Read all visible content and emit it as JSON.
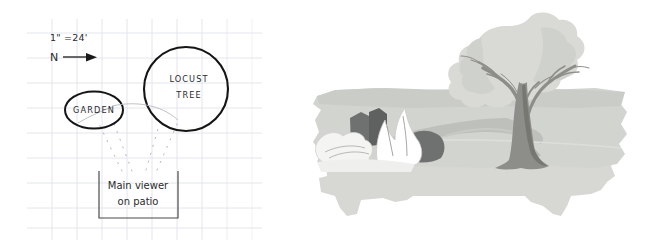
{
  "figure": {
    "type": "landscape-design-illustration",
    "panels": [
      "site-plan-sketch",
      "perspective-view-sketch"
    ]
  },
  "plan": {
    "scale_note": "1\" =24'",
    "north_label": "N",
    "north_arrow_glyph": "arrow-right",
    "elements": [
      {
        "name": "garden",
        "label": "GARDEN",
        "shape": "ellipse"
      },
      {
        "name": "locust-tree",
        "label_line1": "LOCUST",
        "label_line2": "TREE",
        "shape": "circle"
      },
      {
        "name": "viewer-box",
        "label_line1": "Main viewer",
        "label_line2": "on patio",
        "shape": "open-top-rectangle"
      }
    ],
    "sight_lines": "dotted fan from viewer box to garden and locust tree",
    "grid": {
      "visible": true,
      "spacing_px": 25,
      "color": "#dfe3ec"
    },
    "ink_color": "#1a1a1a"
  },
  "view": {
    "title": "",
    "elements": [
      {
        "name": "tree",
        "description": "locust tree with canopy, trunk and branches"
      },
      {
        "name": "tree-shadow",
        "description": "cast shadow on lawn"
      },
      {
        "name": "garden-bed",
        "description": "shrubs and flowering plants massing"
      },
      {
        "name": "lawn",
        "description": "mid-ground lawn band"
      },
      {
        "name": "patio",
        "description": "foreground patio slab with scalloped edge"
      }
    ]
  },
  "colors": {
    "paper": "#ffffff",
    "grid_line": "#dfe3ec",
    "ink": "#1a1a1a",
    "sight_line": "#9aa0ab",
    "canopy_light": "#d9dad6",
    "canopy_mid": "#cfd1cc",
    "trunk": "#8d8d89",
    "trunk_dark": "#777772",
    "lawn": "#d2d4d0",
    "lawn_shadow": "#bdc0bb",
    "patio": "#d7d8d4",
    "shrub_dark": "#6f7170",
    "shrub_mid": "#9a9c99",
    "flower_light": "#f4f4f2"
  }
}
